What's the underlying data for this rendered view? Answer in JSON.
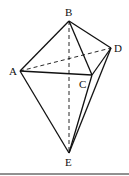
{
  "diagram": {
    "type": "geometry",
    "points": {
      "A": {
        "label": "A",
        "x": 20,
        "y": 71
      },
      "B": {
        "label": "B",
        "x": 69,
        "y": 21
      },
      "C": {
        "label": "C",
        "x": 92,
        "y": 75
      },
      "D": {
        "label": "D",
        "x": 111,
        "y": 48
      },
      "E": {
        "label": "E",
        "x": 69,
        "y": 153
      }
    },
    "solid_edges": [
      [
        "A",
        "B"
      ],
      [
        "B",
        "C"
      ],
      [
        "B",
        "D"
      ],
      [
        "A",
        "C"
      ],
      [
        "C",
        "D"
      ],
      [
        "A",
        "E"
      ],
      [
        "C",
        "E"
      ],
      [
        "D",
        "E"
      ]
    ],
    "dashed_edges": [
      [
        "A",
        "D"
      ],
      [
        "B",
        "E"
      ]
    ],
    "line_color": "#111111"
  }
}
